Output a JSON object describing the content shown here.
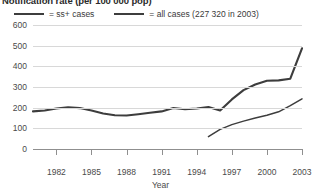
{
  "chart_data": {
    "type": "line",
    "title": "Notification rate (per 100 000 pop)",
    "xlabel": "Year",
    "ylabel": "",
    "xlim": [
      1980,
      2003
    ],
    "ylim": [
      0,
      600
    ],
    "ytick_labels": [
      "600",
      "500",
      "400",
      "300",
      "200",
      "100",
      "0"
    ],
    "ytick_values": [
      600,
      500,
      400,
      300,
      200,
      100,
      0
    ],
    "xtick_labels": [
      "1982",
      "1985",
      "1988",
      "1991",
      "1994",
      "1997",
      "2000",
      "2003"
    ],
    "xtick_values": [
      1982,
      1985,
      1988,
      1991,
      1994,
      1997,
      2000,
      2003
    ],
    "grid": true,
    "legend_position": "top-left",
    "series": [
      {
        "name": "ss+ cases",
        "legend_label": "= ss+ cases",
        "style": "thin",
        "color": "#3d3d3d",
        "x": [
          1995,
          1996,
          1997,
          1998,
          1999,
          2000,
          2001,
          2002,
          2003
        ],
        "values": [
          60,
          95,
          118,
          135,
          150,
          163,
          180,
          210,
          243
        ]
      },
      {
        "name": "all cases",
        "legend_label": "= all cases (227 320 in 2003)",
        "style": "thick",
        "color": "#3d3d3d",
        "x": [
          1980,
          1981,
          1982,
          1983,
          1984,
          1985,
          1986,
          1987,
          1988,
          1989,
          1990,
          1991,
          1992,
          1993,
          1994,
          1995,
          1996,
          1997,
          1998,
          1999,
          2000,
          2001,
          2002,
          2003
        ],
        "values": [
          182,
          186,
          196,
          202,
          198,
          186,
          172,
          163,
          162,
          168,
          175,
          182,
          198,
          192,
          196,
          203,
          186,
          240,
          285,
          312,
          330,
          332,
          340,
          487
        ]
      }
    ],
    "annotations": [
      {
        "text": "227 320 in 2003",
        "refers_to": "all cases"
      }
    ]
  }
}
